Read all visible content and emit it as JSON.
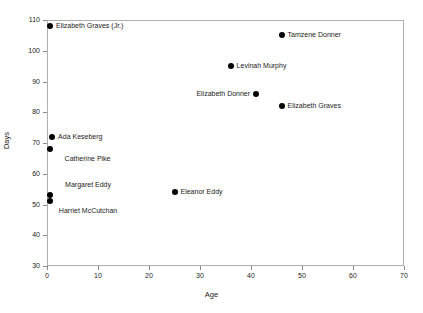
{
  "chart_data": {
    "type": "scatter",
    "title": "",
    "xlabel": "Age",
    "ylabel": "Days",
    "xlim": [
      0,
      70
    ],
    "ylim": [
      30,
      110
    ],
    "xticks": [
      0,
      10,
      20,
      30,
      40,
      50,
      60,
      70
    ],
    "yticks": [
      30,
      40,
      50,
      60,
      70,
      80,
      90,
      100,
      110
    ],
    "grid": false,
    "legend": "none",
    "marker_color": "#000000",
    "points": [
      {
        "label": "Elizabeth Graves (Jr.)",
        "x": 0.6,
        "y": 108,
        "label_pos": "right"
      },
      {
        "label": "Tamzene Donner",
        "x": 46,
        "y": 105,
        "label_pos": "right"
      },
      {
        "label": "Levinah Murphy",
        "x": 36,
        "y": 95,
        "label_pos": "right"
      },
      {
        "label": "Elizabeth Donner",
        "x": 41,
        "y": 86,
        "label_pos": "left"
      },
      {
        "label": "Elizabeth Graves",
        "x": 46,
        "y": 82,
        "label_pos": "right"
      },
      {
        "label": "Ada Keseberg",
        "x": 1,
        "y": 72,
        "label_pos": "right"
      },
      {
        "label": "Catherine Pike",
        "x": 0.5,
        "y": 68,
        "label_pos": "below"
      },
      {
        "label": "Margaret Eddy",
        "x": 0.6,
        "y": 53,
        "label_pos": "above"
      },
      {
        "label": "Harriet McCutchan",
        "x": 0.6,
        "y": 51,
        "label_pos": "below"
      },
      {
        "label": "Eleanor Eddy",
        "x": 25,
        "y": 54,
        "label_pos": "right"
      }
    ]
  }
}
